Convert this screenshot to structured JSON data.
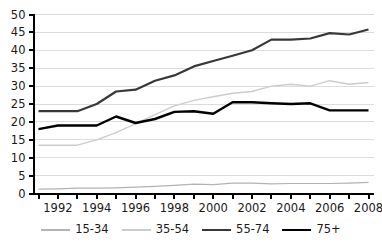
{
  "chart_data": {
    "type": "line",
    "title": "",
    "xlabel": "",
    "ylabel": "",
    "x": [
      1991,
      1992,
      1993,
      1994,
      1995,
      1996,
      1997,
      1998,
      1999,
      2000,
      2001,
      2002,
      2003,
      2004,
      2005,
      2006,
      2007,
      2008
    ],
    "x_labeled_ticks": [
      1992,
      1994,
      1996,
      1998,
      2000,
      2002,
      2004,
      2006,
      2008
    ],
    "ylim": [
      0,
      50
    ],
    "y_ticks": [
      0,
      5,
      10,
      15,
      20,
      25,
      30,
      35,
      40,
      45,
      50
    ],
    "grid": "horizontal",
    "legend_position": "bottom",
    "background_color": "#ffffff",
    "grid_color": "#dcdcdc",
    "axis_color": "#000000",
    "label_color": "#1a1a1a",
    "series": [
      {
        "name": "15-34",
        "color": "#b3b3b3",
        "width": 1.2,
        "values": [
          1.2,
          1.3,
          1.5,
          1.5,
          1.6,
          1.8,
          2.0,
          2.3,
          2.6,
          2.5,
          2.9,
          2.9,
          2.7,
          2.8,
          2.8,
          2.8,
          2.9,
          3.1
        ]
      },
      {
        "name": "35-54",
        "color": "#cccccc",
        "width": 1.4,
        "values": [
          13.5,
          13.5,
          13.5,
          15,
          17,
          19.5,
          22,
          24.5,
          26,
          27,
          28,
          28.5,
          30,
          30.5,
          30,
          31.5,
          30.5,
          31
        ]
      },
      {
        "name": "55-74",
        "color": "#383838",
        "width": 2.2,
        "values": [
          23,
          23,
          23,
          25,
          28.5,
          29,
          31.5,
          33,
          35.5,
          37,
          38.5,
          40,
          43,
          43,
          43.3,
          44.8,
          44.4,
          45.8
        ]
      },
      {
        "name": "75+",
        "color": "#000000",
        "width": 2.4,
        "values": [
          18,
          19,
          19,
          19,
          21.5,
          19.7,
          20.8,
          22.8,
          23,
          22.3,
          25.5,
          25.5,
          25.2,
          25,
          25.2,
          23.2,
          23.2,
          23.2
        ]
      }
    ]
  }
}
